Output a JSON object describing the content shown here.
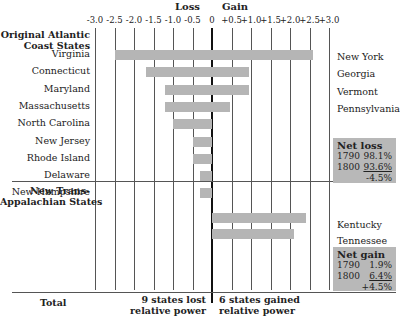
{
  "header": {
    "loss": "Loss",
    "gain": "Gain"
  },
  "ticks": [
    "-3.0",
    "-2.5",
    "-2.0",
    "-1.5",
    "-1.0",
    "-0.5",
    "0",
    "+0.5",
    "+1.0",
    "+1.5",
    "+2.0",
    "+2.5",
    "+3.0"
  ],
  "groups": {
    "atlantic": "Original Atlantic\nCoast States",
    "trans": "New Trans-\nAppalachian States",
    "total": "Total"
  },
  "losers": [
    {
      "label": "Virginia",
      "value": -2.5
    },
    {
      "label": "Connecticut",
      "value": -1.7
    },
    {
      "label": "Maryland",
      "value": -1.2
    },
    {
      "label": "Massachusetts",
      "value": -1.2
    },
    {
      "label": "North Carolina",
      "value": -1.0
    },
    {
      "label": "New Jersey",
      "value": -0.5
    },
    {
      "label": "Rhode Island",
      "value": -0.5
    },
    {
      "label": "Delaware",
      "value": -0.3
    },
    {
      "label": "New Hampshire",
      "value": -0.3
    }
  ],
  "gainers_atlantic": [
    {
      "label": "New York",
      "value": 2.6
    },
    {
      "label": "Georgia",
      "value": 0.95
    },
    {
      "label": "Vermont",
      "value": 0.95
    },
    {
      "label": "Pennsylvania",
      "value": 0.45
    }
  ],
  "gainers_trans": [
    {
      "label": "Kentucky",
      "value": 2.4
    },
    {
      "label": "Tennessee",
      "value": 2.1
    }
  ],
  "net_loss": {
    "title": "Net loss",
    "y1": "1790",
    "v1": "98.1%",
    "y2": "1800",
    "v2": "93.6%",
    "diff": "-4.5%"
  },
  "net_gain": {
    "title": "Net gain",
    "y1": "1790",
    "v1": "1.9%",
    "y2": "1800",
    "v2": "6.4%",
    "diff": "+4.5%"
  },
  "footer": {
    "lost": "9 states lost\nrelative power",
    "gained": "6 states gained\nrelative power"
  },
  "chart_data": {
    "type": "bar",
    "orientation": "horizontal",
    "title": "",
    "xlabel": "Loss / Gain",
    "xlim": [
      -3.0,
      3.0
    ],
    "x_ticks": [
      -3.0,
      -2.5,
      -2.0,
      -1.5,
      -1.0,
      -0.5,
      0,
      0.5,
      1.0,
      1.5,
      2.0,
      2.5,
      3.0
    ],
    "grid": true,
    "series": [
      {
        "name": "Original Atlantic Coast States - Loss",
        "categories": [
          "Virginia",
          "Connecticut",
          "Maryland",
          "Massachusetts",
          "North Carolina",
          "New Jersey",
          "Rhode Island",
          "Delaware",
          "New Hampshire"
        ],
        "values": [
          -2.5,
          -1.7,
          -1.2,
          -1.2,
          -1.0,
          -0.5,
          -0.5,
          -0.3,
          -0.3
        ]
      },
      {
        "name": "Original Atlantic Coast States - Gain",
        "categories": [
          "New York",
          "Georgia",
          "Vermont",
          "Pennsylvania"
        ],
        "values": [
          2.6,
          0.95,
          0.95,
          0.45
        ]
      },
      {
        "name": "New Trans-Appalachian States - Gain",
        "categories": [
          "Kentucky",
          "Tennessee"
        ],
        "values": [
          2.4,
          2.1
        ]
      }
    ],
    "annotations": [
      "Net loss: 1790 98.1%, 1800 93.6%, -4.5%",
      "Net gain: 1790 1.9%, 1800 6.4%, +4.5%",
      "9 states lost relative power",
      "6 states gained relative power"
    ]
  }
}
